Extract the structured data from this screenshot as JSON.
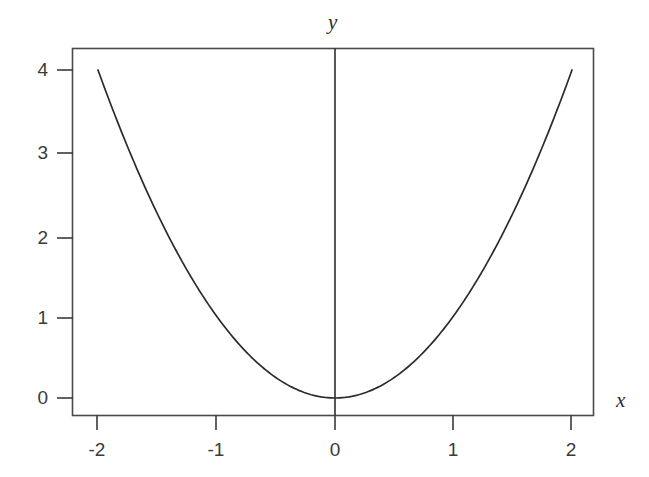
{
  "chart_data": {
    "type": "line",
    "title": "",
    "subtitle": "",
    "function": "y = x^2",
    "xlabel": "x",
    "ylabel": "y",
    "xlim": [
      -2.18,
      2.2
    ],
    "ylim": [
      -0.22,
      4.6
    ],
    "grid": false,
    "legend": null,
    "xticks": [
      -2,
      -1,
      0,
      1,
      2
    ],
    "xtick_labels": [
      "-2",
      "-1",
      "0",
      "1",
      "2"
    ],
    "yticks": [
      0,
      1,
      2,
      3,
      4
    ],
    "ytick_labels": [
      "0",
      "1",
      "2",
      "3",
      "4"
    ],
    "series": [
      {
        "name": "y = x^2",
        "color": "#2b2b2b",
        "x": [
          -2,
          -1.9,
          -1.8,
          -1.7,
          -1.6,
          -1.5,
          -1.4,
          -1.3,
          -1.2,
          -1.1,
          -1,
          -0.9,
          -0.8,
          -0.7,
          -0.6,
          -0.5,
          -0.4,
          -0.3,
          -0.2,
          -0.1,
          0,
          0.1,
          0.2,
          0.3,
          0.4,
          0.5,
          0.6,
          0.7,
          0.8,
          0.9,
          1,
          1.1,
          1.2,
          1.3,
          1.4,
          1.5,
          1.6,
          1.7,
          1.8,
          1.9,
          2
        ],
        "y": [
          4,
          3.61,
          3.24,
          2.89,
          2.56,
          2.25,
          1.96,
          1.69,
          1.44,
          1.21,
          1,
          0.81,
          0.64,
          0.49,
          0.36,
          0.25,
          0.16,
          0.09,
          0.04,
          0.01,
          0,
          0.01,
          0.04,
          0.09,
          0.16,
          0.25,
          0.36,
          0.49,
          0.64,
          0.81,
          1,
          1.21,
          1.44,
          1.69,
          1.96,
          2.25,
          2.56,
          2.89,
          3.24,
          3.61,
          4
        ]
      }
    ],
    "annotations": [],
    "style": {
      "frame": "box",
      "frame_color": "#4a4a4a",
      "vertical_axis_line_at_x": 0,
      "tick_direction": "outward",
      "background": "#ffffff",
      "line_color": "#2b2b2b"
    }
  },
  "axis_names": {
    "y": "y",
    "x": "x"
  }
}
